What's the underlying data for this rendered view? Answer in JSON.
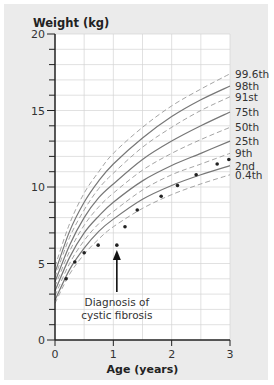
{
  "chart_data": {
    "type": "line",
    "title": "",
    "xlabel": "Age (years)",
    "ylabel": "Weight (kg)",
    "xlim": [
      0,
      3
    ],
    "ylim": [
      0,
      20
    ],
    "x_ticks": [
      "0",
      "1",
      "2",
      "3"
    ],
    "y_ticks": [
      "0",
      "5",
      "10",
      "15",
      "20"
    ],
    "grid": true,
    "legend_position": "right-end labels",
    "x": [
      0,
      0.25,
      0.5,
      0.75,
      1,
      1.5,
      2,
      2.5,
      3
    ],
    "series": [
      {
        "name": "99.6th",
        "style": "dashed",
        "values": [
          4.8,
          7.6,
          9.6,
          11.0,
          12.2,
          13.9,
          15.3,
          16.4,
          17.4
        ]
      },
      {
        "name": "98th",
        "style": "solid",
        "values": [
          4.4,
          7.1,
          9.0,
          10.4,
          11.5,
          13.2,
          14.6,
          15.7,
          16.6
        ]
      },
      {
        "name": "91st",
        "style": "dashed",
        "values": [
          4.1,
          6.7,
          8.5,
          9.9,
          10.9,
          12.6,
          13.9,
          15.0,
          15.9
        ]
      },
      {
        "name": "75th",
        "style": "solid",
        "values": [
          3.8,
          6.2,
          8.0,
          9.3,
          10.2,
          11.8,
          13.0,
          14.0,
          14.9
        ]
      },
      {
        "name": "50th",
        "style": "dashed",
        "values": [
          3.5,
          5.8,
          7.5,
          8.7,
          9.6,
          11.1,
          12.2,
          13.1,
          13.9
        ]
      },
      {
        "name": "25th",
        "style": "solid",
        "values": [
          3.2,
          5.4,
          7.0,
          8.1,
          9.0,
          10.4,
          11.4,
          12.2,
          13.0
        ]
      },
      {
        "name": "9th",
        "style": "dashed",
        "values": [
          2.9,
          5.0,
          6.5,
          7.6,
          8.4,
          9.8,
          10.8,
          11.5,
          12.2
        ]
      },
      {
        "name": "2nd",
        "style": "solid",
        "values": [
          2.6,
          4.6,
          6.0,
          7.1,
          7.9,
          9.2,
          10.1,
          10.8,
          11.4
        ]
      },
      {
        "name": "0.4th",
        "style": "dashed",
        "values": [
          2.4,
          4.3,
          5.6,
          6.6,
          7.4,
          8.6,
          9.5,
          10.2,
          10.8
        ]
      }
    ],
    "patient_points": {
      "name": "Patient weight",
      "x": [
        0.19,
        0.34,
        0.5,
        0.74,
        1.06,
        1.2,
        1.41,
        1.82,
        2.1,
        2.42,
        2.78,
        2.98
      ],
      "y": [
        4.0,
        5.1,
        5.7,
        6.2,
        6.2,
        7.4,
        8.5,
        9.4,
        10.1,
        10.8,
        11.5,
        11.8
      ]
    },
    "annotations": [
      {
        "text": "Diagnosis of cystic fibrosis",
        "arrow_to": {
          "x": 1.06,
          "y": 6.2
        }
      }
    ]
  },
  "labels": {
    "y_axis_title": "Weight (kg)",
    "x_axis_title": "Age (years)",
    "annotation_line1": "Diagnosis of",
    "annotation_line2": "cystic fibrosis"
  },
  "colors": {
    "panel": "#ebebeb",
    "plot": "#ffffff",
    "grid": "#d4d4d4",
    "solid_curve": "#777777",
    "dashed_curve": "#9a9a9a",
    "axis": "#222222",
    "point": "#222222"
  }
}
